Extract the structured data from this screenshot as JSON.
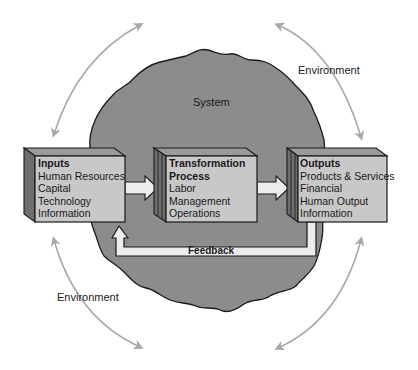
{
  "diagram": {
    "system_label": "System",
    "environment_labels": [
      "Environment",
      "Environment"
    ],
    "boxes": [
      {
        "id": "inputs",
        "title": "Inputs",
        "items": [
          "Human Resources",
          "Capital",
          "Technology",
          "Information"
        ]
      },
      {
        "id": "transformation",
        "title_lines": [
          "Transformation",
          "Process"
        ],
        "items": [
          "Labor",
          "Management",
          "Operations"
        ]
      },
      {
        "id": "outputs",
        "title": "Outputs",
        "items": [
          "Products & Services",
          "Financial",
          "Human Output",
          "Information"
        ]
      }
    ],
    "feedback_label": "Feedback",
    "colors": {
      "system_blob": "#8c8c8c",
      "box_face": "#c8c8c8",
      "box_side": "#6e6e6e",
      "arrow_fill": "#ececec",
      "environment_arrows": "#a8a8a8",
      "outline": "#1a1a1a"
    }
  }
}
